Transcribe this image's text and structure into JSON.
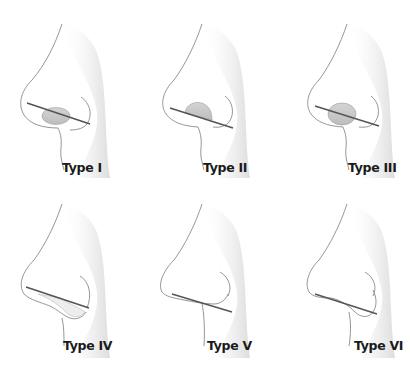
{
  "figure": {
    "colors": {
      "outline": "#8a8a8a",
      "shadow": "#e6e6e6",
      "lobule_fill": "#c9c9c9",
      "reference_line": "#555555",
      "label": "#1a1a1a"
    },
    "panels": [
      {
        "label": "Type I",
        "feature": "nostril-ellipse-below-line"
      },
      {
        "label": "Type II",
        "feature": "nostril-dome-above-line"
      },
      {
        "label": "Type III",
        "feature": "nostril-ellipse-across-line"
      },
      {
        "label": "Type IV",
        "feature": "columella-hanging-below-line"
      },
      {
        "label": "Type V",
        "feature": "line-tangent-to-columella"
      },
      {
        "label": "Type VI",
        "feature": "alar-overlap-below-line"
      }
    ]
  }
}
